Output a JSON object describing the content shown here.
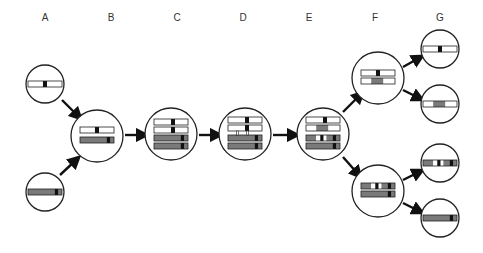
{
  "labels": [
    {
      "text": "A",
      "x": 45
    },
    {
      "text": "B",
      "x": 111
    },
    {
      "text": "C",
      "x": 177
    },
    {
      "text": "D",
      "x": 243
    },
    {
      "text": "E",
      "x": 309
    },
    {
      "text": "F",
      "x": 375
    },
    {
      "text": "G",
      "x": 440
    }
  ],
  "colors": {
    "white": "#ffffff",
    "gray": "#7a7a7a",
    "black": "#111111",
    "stroke": "#222222"
  },
  "cells": [
    {
      "id": "A1",
      "cx": 45,
      "cy": 84,
      "r": 19,
      "bars": [
        {
          "y": 0,
          "segs": [
            [
              "w",
              0,
              0.44
            ],
            [
              "k",
              0.44,
              0.56
            ],
            [
              "w",
              0.56,
              1
            ]
          ]
        }
      ]
    },
    {
      "id": "A2",
      "cx": 45,
      "cy": 192,
      "r": 19,
      "bars": [
        {
          "y": 0,
          "segs": [
            [
              "g",
              0,
              0.78
            ],
            [
              "k",
              0.78,
              0.9
            ],
            [
              "g",
              0.9,
              1
            ]
          ]
        }
      ]
    },
    {
      "id": "B",
      "cx": 97,
      "cy": 136,
      "r": 26,
      "bars": [
        {
          "y": -6,
          "segs": [
            [
              "w",
              0,
              0.44
            ],
            [
              "k",
              0.44,
              0.56
            ],
            [
              "w",
              0.56,
              1
            ]
          ]
        },
        {
          "y": 4,
          "segs": [
            [
              "g",
              0,
              0.78
            ],
            [
              "k",
              0.78,
              0.9
            ],
            [
              "g",
              0.9,
              1
            ]
          ]
        }
      ]
    },
    {
      "id": "C",
      "cx": 171,
      "cy": 134,
      "r": 26,
      "bars": [
        {
          "y": -12,
          "segs": [
            [
              "w",
              0,
              0.5
            ],
            [
              "k",
              0.5,
              0.62
            ],
            [
              "w",
              0.62,
              1
            ]
          ]
        },
        {
          "y": -4,
          "segs": [
            [
              "w",
              0,
              0.5
            ],
            [
              "k",
              0.5,
              0.62
            ],
            [
              "w",
              0.62,
              1
            ]
          ]
        },
        {
          "y": 4,
          "segs": [
            [
              "g",
              0,
              0.78
            ],
            [
              "k",
              0.78,
              0.9
            ],
            [
              "g",
              0.9,
              1
            ]
          ]
        },
        {
          "y": 12,
          "segs": [
            [
              "g",
              0,
              0.78
            ],
            [
              "k",
              0.78,
              0.9
            ],
            [
              "g",
              0.9,
              1
            ]
          ]
        }
      ]
    },
    {
      "id": "D",
      "cx": 245,
      "cy": 134,
      "r": 26,
      "bars": [
        {
          "y": -14,
          "segs": [
            [
              "w",
              0,
              0.5
            ],
            [
              "k",
              0.5,
              0.62
            ],
            [
              "w",
              0.62,
              1
            ]
          ]
        },
        {
          "y": -6,
          "segs": [
            [
              "w",
              0,
              0.5
            ],
            [
              "k",
              0.5,
              0.62
            ],
            [
              "w",
              0.62,
              1
            ]
          ]
        },
        {
          "y": 4,
          "segs": [
            [
              "g",
              0,
              0.78
            ],
            [
              "k",
              0.78,
              0.9
            ],
            [
              "g",
              0.9,
              1
            ]
          ]
        },
        {
          "y": 12,
          "segs": [
            [
              "g",
              0,
              0.78
            ],
            [
              "k",
              0.78,
              0.9
            ],
            [
              "g",
              0.9,
              1
            ]
          ]
        }
      ],
      "links": true
    },
    {
      "id": "E",
      "cx": 323,
      "cy": 134,
      "r": 26,
      "bars": [
        {
          "y": -14,
          "segs": [
            [
              "w",
              0,
              0.5
            ],
            [
              "k",
              0.5,
              0.62
            ],
            [
              "w",
              0.62,
              1
            ]
          ]
        },
        {
          "y": -6,
          "segs": [
            [
              "w",
              0,
              0.3
            ],
            [
              "g",
              0.3,
              0.66
            ],
            [
              "w",
              0.66,
              1
            ]
          ]
        },
        {
          "y": 4,
          "segs": [
            [
              "g",
              0,
              0.3
            ],
            [
              "w",
              0.3,
              0.42
            ],
            [
              "k",
              0.42,
              0.52
            ],
            [
              "w",
              0.52,
              0.6
            ],
            [
              "g",
              0.6,
              0.78
            ],
            [
              "k",
              0.78,
              0.9
            ],
            [
              "g",
              0.9,
              1
            ]
          ]
        },
        {
          "y": 12,
          "segs": [
            [
              "g",
              0,
              0.78
            ],
            [
              "k",
              0.78,
              0.9
            ],
            [
              "g",
              0.9,
              1
            ]
          ]
        }
      ]
    },
    {
      "id": "F1",
      "cx": 378,
      "cy": 78,
      "r": 26,
      "bars": [
        {
          "y": -5,
          "segs": [
            [
              "w",
              0,
              0.44
            ],
            [
              "k",
              0.44,
              0.56
            ],
            [
              "w",
              0.56,
              1
            ]
          ]
        },
        {
          "y": 3,
          "segs": [
            [
              "w",
              0,
              0.3
            ],
            [
              "g",
              0.3,
              0.66
            ],
            [
              "w",
              0.66,
              1
            ]
          ]
        }
      ]
    },
    {
      "id": "F2",
      "cx": 378,
      "cy": 191,
      "r": 26,
      "bars": [
        {
          "y": -5,
          "segs": [
            [
              "g",
              0,
              0.3
            ],
            [
              "w",
              0.3,
              0.42
            ],
            [
              "k",
              0.42,
              0.52
            ],
            [
              "w",
              0.52,
              0.6
            ],
            [
              "g",
              0.6,
              0.78
            ],
            [
              "k",
              0.78,
              0.9
            ],
            [
              "g",
              0.9,
              1
            ]
          ]
        },
        {
          "y": 3,
          "segs": [
            [
              "g",
              0,
              0.78
            ],
            [
              "k",
              0.78,
              0.9
            ],
            [
              "g",
              0.9,
              1
            ]
          ]
        }
      ]
    },
    {
      "id": "G1",
      "cx": 440,
      "cy": 49,
      "r": 19,
      "bars": [
        {
          "y": 0,
          "segs": [
            [
              "w",
              0,
              0.44
            ],
            [
              "k",
              0.44,
              0.56
            ],
            [
              "w",
              0.56,
              1
            ]
          ]
        }
      ]
    },
    {
      "id": "G2",
      "cx": 440,
      "cy": 104,
      "r": 19,
      "bars": [
        {
          "y": 0,
          "segs": [
            [
              "w",
              0,
              0.3
            ],
            [
              "g",
              0.3,
              0.66
            ],
            [
              "w",
              0.66,
              1
            ]
          ]
        }
      ]
    },
    {
      "id": "G3",
      "cx": 440,
      "cy": 163,
      "r": 19,
      "bars": [
        {
          "y": 0,
          "segs": [
            [
              "g",
              0,
              0.3
            ],
            [
              "w",
              0.3,
              0.42
            ],
            [
              "k",
              0.42,
              0.52
            ],
            [
              "w",
              0.52,
              0.6
            ],
            [
              "g",
              0.6,
              0.78
            ],
            [
              "k",
              0.78,
              0.9
            ],
            [
              "g",
              0.9,
              1
            ]
          ]
        }
      ]
    },
    {
      "id": "G4",
      "cx": 440,
      "cy": 218,
      "r": 19,
      "bars": [
        {
          "y": 0,
          "segs": [
            [
              "g",
              0,
              0.78
            ],
            [
              "k",
              0.78,
              0.9
            ],
            [
              "g",
              0.9,
              1
            ]
          ]
        }
      ]
    }
  ],
  "arrows": [
    {
      "from": [
        62,
        100
      ],
      "to": [
        78,
        116
      ]
    },
    {
      "from": [
        60,
        175
      ],
      "to": [
        76,
        160
      ]
    },
    {
      "from": [
        125,
        135
      ],
      "to": [
        143,
        135
      ]
    },
    {
      "from": [
        199,
        135
      ],
      "to": [
        217,
        135
      ]
    },
    {
      "from": [
        273,
        135
      ],
      "to": [
        294,
        135
      ]
    },
    {
      "from": [
        343,
        112
      ],
      "to": [
        360,
        95
      ]
    },
    {
      "from": [
        343,
        157
      ],
      "to": [
        358,
        174
      ]
    },
    {
      "from": [
        403,
        67
      ],
      "to": [
        419,
        58
      ]
    },
    {
      "from": [
        403,
        90
      ],
      "to": [
        419,
        98
      ]
    },
    {
      "from": [
        403,
        180
      ],
      "to": [
        419,
        172
      ]
    },
    {
      "from": [
        403,
        203
      ],
      "to": [
        419,
        211
      ]
    }
  ],
  "bar_geometry": {
    "width": 34,
    "height": 6
  }
}
